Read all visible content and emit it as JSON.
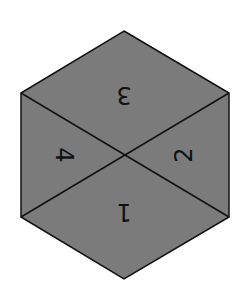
{
  "diagram": {
    "shape": "hexagon",
    "fill_color": "#7b7b7b",
    "stroke_color": "#111111",
    "vertices": [
      [
        124,
        31
      ],
      [
        229,
        93
      ],
      [
        229,
        217
      ],
      [
        124,
        279
      ],
      [
        21,
        217
      ],
      [
        21,
        93
      ]
    ],
    "center": [
      124,
      155
    ],
    "regions": [
      {
        "label": "3",
        "x": 124,
        "y": 95,
        "rotation": 180
      },
      {
        "label": "2",
        "x": 184,
        "y": 155,
        "rotation": 270
      },
      {
        "label": "1",
        "x": 124,
        "y": 212,
        "rotation": 180
      },
      {
        "label": "4",
        "x": 64,
        "y": 155,
        "rotation": 90
      }
    ]
  }
}
